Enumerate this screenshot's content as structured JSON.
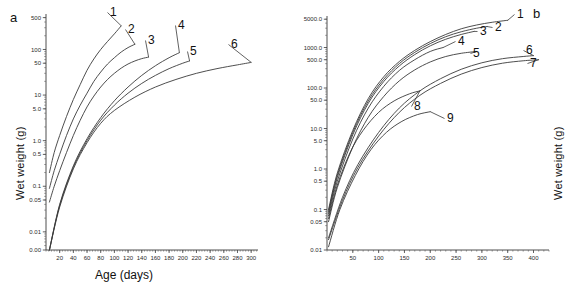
{
  "figure": {
    "panel_a_letter": "a",
    "panel_b_letter": "b"
  },
  "chart_data": [
    {
      "type": "line",
      "panel": "a",
      "title": "",
      "xlabel": "Age (days)",
      "ylabel": "Wet weight (g)",
      "xlim": [
        0,
        310
      ],
      "ylim": [
        0.004,
        600
      ],
      "yscale": "log",
      "grid": false,
      "legend_position": "inline-end-labels",
      "ytick_labels": [
        "500",
        "100",
        "50",
        "10",
        "5.0",
        "1.0",
        "0.5",
        "0.1",
        "0.05",
        "0.01",
        "0.00"
      ],
      "ytick_values": [
        500,
        100,
        50,
        10,
        5.0,
        1.0,
        0.5,
        0.1,
        0.05,
        0.01,
        0.004
      ],
      "xtick_labels": [
        "20",
        "40",
        "60",
        "80",
        "100",
        "120",
        "140",
        "160",
        "180",
        "200",
        "220",
        "240",
        "260",
        "280",
        "300"
      ],
      "xtick_values": [
        20,
        40,
        60,
        80,
        100,
        120,
        140,
        160,
        180,
        200,
        220,
        240,
        260,
        280,
        300
      ],
      "series": [
        {
          "name": "1",
          "label": "1",
          "x": [
            5,
            12,
            20,
            30,
            40,
            50,
            60,
            70,
            80,
            90,
            100,
            110
          ],
          "values": [
            0.2,
            0.55,
            1.3,
            3.4,
            8.0,
            17,
            35,
            62,
            100,
            150,
            220,
            330
          ]
        },
        {
          "name": "2",
          "label": "2",
          "x": [
            5,
            12,
            20,
            30,
            40,
            50,
            60,
            70,
            80,
            90,
            100,
            110,
            120,
            130
          ],
          "values": [
            0.09,
            0.22,
            0.5,
            1.3,
            3.0,
            6.0,
            11,
            20,
            32,
            48,
            66,
            88,
            110,
            130
          ]
        },
        {
          "name": "3",
          "label": "3",
          "x": [
            5,
            12,
            20,
            30,
            40,
            50,
            60,
            70,
            80,
            90,
            100,
            110,
            120,
            130,
            140,
            150
          ],
          "values": [
            0.045,
            0.1,
            0.22,
            0.55,
            1.3,
            2.8,
            5.5,
            9.5,
            15,
            22,
            30,
            39,
            48,
            56,
            63,
            68
          ]
        },
        {
          "name": "4",
          "label": "4",
          "x": [
            5,
            20,
            40,
            60,
            80,
            100,
            120,
            140,
            160,
            180,
            195
          ],
          "values": [
            0.004,
            0.04,
            0.28,
            1.1,
            3.2,
            7.5,
            15,
            27,
            44,
            66,
            85
          ]
        },
        {
          "name": "5",
          "label": "5",
          "x": [
            5,
            20,
            40,
            60,
            80,
            100,
            120,
            140,
            160,
            180,
            200,
            210
          ],
          "values": [
            0.004,
            0.038,
            0.26,
            1.0,
            2.8,
            6.0,
            11,
            18,
            27,
            38,
            50,
            56
          ]
        },
        {
          "name": "6",
          "label": "6",
          "x": [
            5,
            20,
            40,
            60,
            80,
            100,
            130,
            160,
            190,
            220,
            250,
            280,
            300
          ],
          "values": [
            0.004,
            0.035,
            0.24,
            0.9,
            2.4,
            4.6,
            9.0,
            15,
            22,
            30,
            38,
            46,
            52
          ]
        }
      ]
    },
    {
      "type": "line",
      "panel": "b",
      "title": "",
      "xlabel": "Age (days)",
      "ylabel": "Wet weight (g)",
      "xlim": [
        0,
        430
      ],
      "ylim": [
        0.01,
        6000
      ],
      "yscale": "log",
      "grid": false,
      "legend_position": "inline-end-labels",
      "ytick_labels": [
        "5000.0",
        "1000.0",
        "500.0",
        "100.0",
        "50.0",
        "10.0",
        "5.0",
        "1.0",
        "0.5",
        "0.1",
        "0.05",
        "0.01"
      ],
      "ytick_values": [
        5000.0,
        1000.0,
        500.0,
        100.0,
        50.0,
        10.0,
        5.0,
        1.0,
        0.5,
        0.1,
        0.05,
        0.01
      ],
      "xtick_labels": [
        "50",
        "100",
        "150",
        "200",
        "250",
        "300",
        "350",
        "400"
      ],
      "xtick_values": [
        50,
        100,
        150,
        200,
        250,
        300,
        350,
        400
      ],
      "series": [
        {
          "name": "1",
          "label": "1",
          "x": [
            3,
            20,
            50,
            80,
            110,
            140,
            170,
            200,
            230,
            260,
            290,
            320,
            350
          ],
          "values": [
            0.1,
            0.8,
            9,
            55,
            190,
            450,
            850,
            1400,
            2100,
            2900,
            3600,
            4200,
            4700
          ]
        },
        {
          "name": "2",
          "label": "2",
          "x": [
            3,
            20,
            50,
            80,
            110,
            140,
            170,
            200,
            230,
            260,
            290,
            310
          ],
          "values": [
            0.09,
            0.7,
            8,
            48,
            165,
            400,
            760,
            1250,
            1850,
            2450,
            3000,
            3300
          ]
        },
        {
          "name": "3",
          "label": "3",
          "x": [
            3,
            20,
            50,
            80,
            110,
            140,
            170,
            200,
            230,
            260,
            285
          ],
          "values": [
            0.08,
            0.62,
            7,
            42,
            145,
            350,
            670,
            1100,
            1600,
            2100,
            2500
          ]
        },
        {
          "name": "4",
          "label": "4",
          "x": [
            3,
            20,
            50,
            80,
            110,
            140,
            170,
            200,
            225
          ],
          "values": [
            0.07,
            0.5,
            5.5,
            32,
            110,
            270,
            500,
            800,
            1000
          ]
        },
        {
          "name": "5",
          "label": "5",
          "x": [
            3,
            20,
            50,
            80,
            110,
            140,
            170,
            200,
            230,
            260,
            290
          ],
          "values": [
            0.05,
            0.35,
            3.5,
            19,
            62,
            150,
            280,
            440,
            600,
            720,
            800
          ]
        },
        {
          "name": "6",
          "label": "6",
          "x": [
            3,
            30,
            60,
            100,
            140,
            180,
            220,
            260,
            300,
            340,
            380,
            400
          ],
          "values": [
            0.02,
            0.2,
            1.3,
            8,
            32,
            85,
            170,
            290,
            420,
            530,
            600,
            630
          ]
        },
        {
          "name": "7",
          "label": "7",
          "x": [
            3,
            30,
            60,
            100,
            140,
            180,
            220,
            260,
            300,
            340,
            380,
            410
          ],
          "values": [
            0.018,
            0.17,
            1.1,
            6.5,
            25,
            66,
            130,
            220,
            320,
            410,
            470,
            500
          ]
        },
        {
          "name": "8",
          "label": "8",
          "x": [
            3,
            20,
            45,
            70,
            100,
            130,
            160,
            180
          ],
          "values": [
            0.06,
            0.4,
            2.6,
            9,
            25,
            48,
            72,
            85
          ]
        },
        {
          "name": "9",
          "label": "9",
          "x": [
            3,
            25,
            55,
            85,
            115,
            145,
            175,
            200
          ],
          "values": [
            0.012,
            0.1,
            0.7,
            3.0,
            8.0,
            15,
            22,
            26
          ]
        }
      ]
    }
  ]
}
